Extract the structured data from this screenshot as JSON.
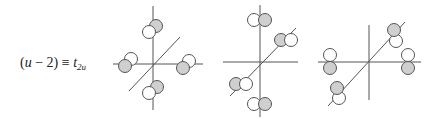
{
  "label": {
    "open_paren": "(",
    "var": "u",
    "minus": " − 2)",
    "equiv": " ≡ ",
    "symbol": "t",
    "subscript": "2u"
  },
  "colors": {
    "shaded": "#cfcfcf",
    "unshaded": "#ffffff",
    "line": "#555555"
  },
  "diagrams": [
    {
      "name": "diagram-1",
      "description": "p-orbital lobes tangential in xy-plane, rotating around z axis",
      "lobe_pairs": [
        {
          "position": "top",
          "shaded_side": "upper-right"
        },
        {
          "position": "left",
          "shaded_side": "lower-left"
        },
        {
          "position": "right",
          "shaded_side": "lower-left"
        },
        {
          "position": "bottom",
          "shaded_side": "upper-right"
        }
      ]
    },
    {
      "name": "diagram-2",
      "description": "p-orbital lobes oriented horizontally along z and diagonal axes",
      "lobe_pairs": [
        {
          "position": "top",
          "shaded_side": "right"
        },
        {
          "position": "diagonal-upper",
          "shaded_side": "left"
        },
        {
          "position": "diagonal-lower",
          "shaded_side": "left"
        },
        {
          "position": "bottom",
          "shaded_side": "right"
        }
      ]
    },
    {
      "name": "diagram-3",
      "description": "p-orbital lobes oriented vertically on x and diagonal axes",
      "lobe_pairs": [
        {
          "position": "left",
          "shaded_side": "bottom"
        },
        {
          "position": "right",
          "shaded_side": "bottom"
        },
        {
          "position": "diagonal-upper",
          "shaded_side": "top"
        },
        {
          "position": "diagonal-lower",
          "shaded_side": "top"
        }
      ]
    }
  ]
}
